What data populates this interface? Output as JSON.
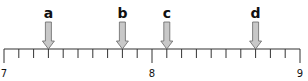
{
  "number_line": {
    "min": 7,
    "max": 9,
    "tick_step": 0.1,
    "labels": [
      {
        "value": 7,
        "text": "7"
      },
      {
        "value": 8,
        "text": "8"
      },
      {
        "value": 9,
        "text": "9"
      }
    ],
    "arrows": [
      {
        "label": "a",
        "value": 7.3
      },
      {
        "label": "b",
        "value": 7.8
      },
      {
        "label": "c",
        "value": 8.1
      },
      {
        "label": "d",
        "value": 8.7
      }
    ],
    "colors": {
      "line": "#333333",
      "arrow_fill": "#c8c8c8",
      "arrow_stroke": "#666666",
      "text": "#111111"
    }
  }
}
